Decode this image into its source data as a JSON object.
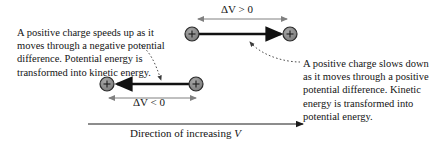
{
  "figure": {
    "background_color": "#ffffff",
    "text_color": "#141414",
    "charge_fill_color": "#8c8c8c",
    "charge_stroke_color": "#2b2b2b",
    "gray_arrow_color": "#808080",
    "black_arrow_color": "#111111",
    "dotted_leader_color": "#3a3a3a"
  },
  "captions": {
    "left": "A positive charge speeds up as it moves through a negative potential difference. Potential energy is transformed into kinetic energy.",
    "right": "A positive charge slows down as it moves through a positive potential difference. Kinetic energy is transformed into potential energy."
  },
  "labels": {
    "delta_v_positive": "ΔV > 0",
    "delta_v_negative": "ΔV < 0",
    "direction_prefix": "Direction of increasing ",
    "direction_variable": "V"
  },
  "diagrams": {
    "top": {
      "name": "positive potential difference case",
      "measure_label": "ΔV > 0",
      "motion_direction": "right",
      "charge_sign": "+",
      "left_charge_label": "+",
      "right_charge_label": "+"
    },
    "bottom": {
      "name": "negative potential difference case",
      "measure_label": "ΔV < 0",
      "motion_direction": "left",
      "charge_sign": "+",
      "left_charge_label": "+",
      "right_charge_label": "+"
    }
  },
  "axis": {
    "label": "Direction of increasing V",
    "direction": "right"
  }
}
